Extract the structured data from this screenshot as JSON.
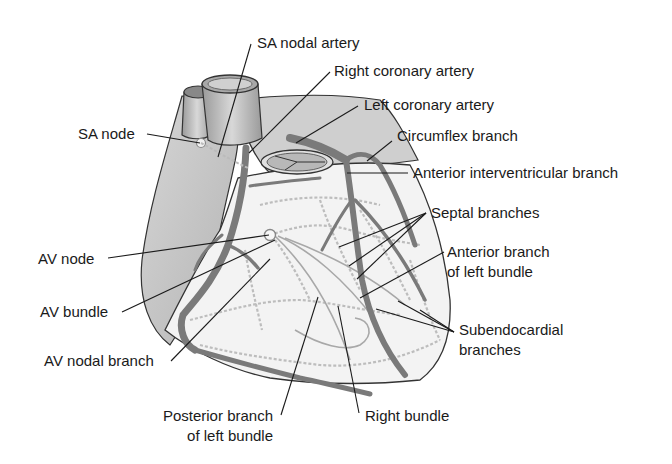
{
  "diagram": {
    "colors": {
      "background": "#ffffff",
      "atrium_fill": "#c4c4c4",
      "ventricle_fill": "#f2f2f2",
      "artery": "#7a7a7a",
      "purkinje": "#bdbdbd",
      "outline": "#333333",
      "label_text": "#1a1a1a"
    }
  },
  "labels": {
    "sa_nodal_artery": "SA nodal artery",
    "right_coronary_artery": "Right coronary artery",
    "left_coronary_artery": "Left coronary artery",
    "circumflex_branch": "Circumflex branch",
    "anterior_interventricular_branch": "Anterior interventricular branch",
    "septal_branches": "Septal branches",
    "anterior_branch_left_bundle_1": "Anterior branch",
    "anterior_branch_left_bundle_2": "of left bundle",
    "subendocardial_branches_1": "Subendocardial",
    "subendocardial_branches_2": "branches",
    "right_bundle": "Right bundle",
    "posterior_branch_left_bundle_1": "Posterior branch",
    "posterior_branch_left_bundle_2": "of left bundle",
    "av_nodal_branch": "AV nodal branch",
    "av_bundle": "AV bundle",
    "av_node": "AV node",
    "sa_node": "SA node"
  }
}
